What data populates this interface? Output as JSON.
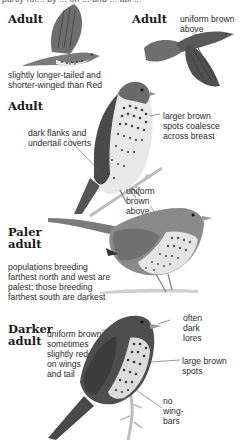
{
  "page": {
    "top_cut_text": "partly ruf... by ... on ... and ... tail ..."
  },
  "figures": [
    {
      "id": "flight-adult-left",
      "heading": "Adult",
      "notes": [
        "slightly longer-tailed and\nshorter-winged than Red"
      ]
    },
    {
      "id": "flight-adult-right",
      "heading": "Adult",
      "notes": [
        "uniform brown\nabove"
      ]
    },
    {
      "id": "perched-adult",
      "heading": "Adult",
      "notes": [
        "dark flanks and\nundertail coverts",
        "larger brown\nspots coalesce\nacross breast",
        "uniform\nbrown\nabove"
      ]
    },
    {
      "id": "paler-adult",
      "heading": "Paler\nadult",
      "notes": [
        "populations breeding\nfarthest north and west are\npalest; those breeding\nfarthest south are darkest"
      ]
    },
    {
      "id": "darker-adult",
      "heading": "Darker\nadult",
      "notes": [
        "uniform brown;\nsometimes\nslightly redder\non wings\nand tail",
        "often\ndark\nlores",
        "large brown\nspots",
        "no\nwing-\nbars"
      ]
    }
  ],
  "colors": {
    "bird_dark": "#4a4a4a",
    "bird_mid": "#6e6e6e",
    "bird_light": "#9a9a9a",
    "breast_light": "#e6e6e6",
    "spot": "#3a3a3a",
    "branch": "#bdbdbd"
  }
}
